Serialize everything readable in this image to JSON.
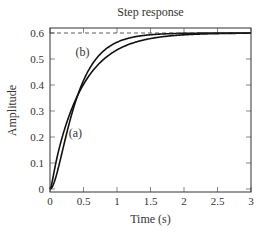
{
  "chart_data": {
    "type": "line",
    "title": "Step response",
    "xlabel": "Time (s)",
    "ylabel": "Amplitude",
    "xlim": [
      0,
      3
    ],
    "ylim": [
      0,
      0.62
    ],
    "xticks": [
      "0",
      "0.5",
      "1",
      "1.5",
      "2",
      "2.5",
      "3"
    ],
    "yticks": [
      "0",
      "0.1",
      "0.2",
      "0.3",
      "0.4",
      "0.5",
      "0.6"
    ],
    "grid": false,
    "reference_line": {
      "y": 0.6,
      "style": "dashed"
    },
    "series": [
      {
        "name": "(b)",
        "x": [
          0,
          0.25,
          0.5,
          0.75,
          1.0,
          1.5,
          2.0,
          2.5,
          3.0
        ],
        "values": [
          0,
          0.25,
          0.4,
          0.48,
          0.54,
          0.58,
          0.6,
          0.6,
          0.6
        ]
      },
      {
        "name": "(a)",
        "x": [
          0,
          0.25,
          0.5,
          0.75,
          1.0,
          1.5,
          2.0,
          2.5,
          3.0
        ],
        "values": [
          0,
          0.14,
          0.33,
          0.44,
          0.51,
          0.575,
          0.595,
          0.6,
          0.6
        ]
      }
    ],
    "annotations": [
      {
        "text": "(b)",
        "x": 0.38,
        "y": 0.51
      },
      {
        "text": "(a)",
        "x": 0.28,
        "y": 0.2
      }
    ]
  }
}
